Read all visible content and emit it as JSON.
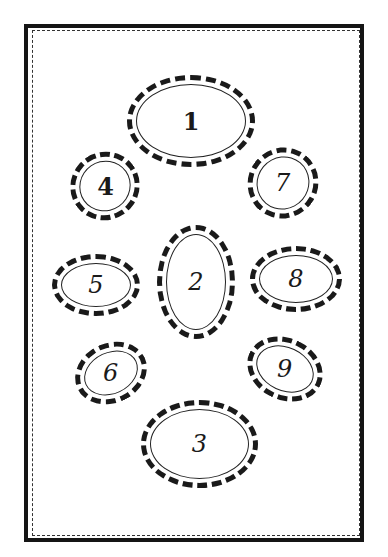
{
  "diagram": {
    "type": "oval-arrangement",
    "ovals": [
      {
        "label": "1",
        "x": 127,
        "y": 75,
        "w": 128,
        "h": 92,
        "rotate": 0,
        "upright": true
      },
      {
        "label": "2",
        "x": 157,
        "y": 225,
        "w": 78,
        "h": 114,
        "rotate": 0,
        "upright": false
      },
      {
        "label": "3",
        "x": 141,
        "y": 400,
        "w": 117,
        "h": 88,
        "rotate": 0,
        "upright": false
      },
      {
        "label": "4",
        "x": 70,
        "y": 152,
        "w": 70,
        "h": 68,
        "rotate": -35,
        "upright": true
      },
      {
        "label": "5",
        "x": 52,
        "y": 254,
        "w": 88,
        "h": 62,
        "rotate": 0,
        "upright": false
      },
      {
        "label": "6",
        "x": 74,
        "y": 343,
        "w": 74,
        "h": 60,
        "rotate": -25,
        "upright": false
      },
      {
        "label": "7",
        "x": 248,
        "y": 147,
        "w": 70,
        "h": 72,
        "rotate": 40,
        "upright": false
      },
      {
        "label": "8",
        "x": 250,
        "y": 246,
        "w": 92,
        "h": 66,
        "rotate": 0,
        "upright": false
      },
      {
        "label": "9",
        "x": 246,
        "y": 338,
        "w": 78,
        "h": 62,
        "rotate": 25,
        "upright": false
      }
    ]
  }
}
